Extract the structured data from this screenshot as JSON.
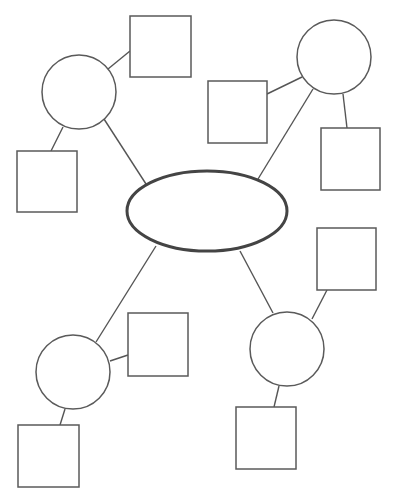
{
  "diagram": {
    "type": "mind-map",
    "background": "#ffffff",
    "stroke_color": "#5a5a5a",
    "center": {
      "id": "center",
      "shape": "ellipse",
      "cx": 207,
      "cy": 211,
      "rx": 80,
      "ry": 40,
      "label": ""
    },
    "branches": [
      {
        "id": "branch-top-left",
        "circle": {
          "cx": 79,
          "cy": 92,
          "r": 37,
          "label": ""
        },
        "connector": {
          "x1": 104,
          "y1": 119,
          "x2": 146,
          "y2": 184
        },
        "leaves": [
          {
            "id": "leaf-top-left-a",
            "x": 130,
            "y": 16,
            "w": 61,
            "h": 61,
            "label": "",
            "connector": {
              "x1": 108,
              "y1": 69,
              "x2": 130,
              "y2": 51
            }
          },
          {
            "id": "leaf-top-left-b",
            "x": 17,
            "y": 151,
            "w": 60,
            "h": 61,
            "label": "",
            "connector": {
              "x1": 63,
              "y1": 127,
              "x2": 51,
              "y2": 151
            }
          }
        ]
      },
      {
        "id": "branch-top-right",
        "circle": {
          "cx": 334,
          "cy": 57,
          "r": 37,
          "label": ""
        },
        "connector": {
          "x1": 313,
          "y1": 89,
          "x2": 258,
          "y2": 179
        },
        "leaves": [
          {
            "id": "leaf-top-right-a",
            "x": 208,
            "y": 81,
            "w": 59,
            "h": 62,
            "label": "",
            "connector": {
              "x1": 302,
              "y1": 77,
              "x2": 267,
              "y2": 94
            }
          },
          {
            "id": "leaf-top-right-b",
            "x": 321,
            "y": 128,
            "w": 59,
            "h": 62,
            "label": "",
            "connector": {
              "x1": 343,
              "y1": 94,
              "x2": 347,
              "y2": 128
            }
          }
        ]
      },
      {
        "id": "branch-bottom-left",
        "circle": {
          "cx": 73,
          "cy": 372,
          "r": 37,
          "label": ""
        },
        "connector": {
          "x1": 156,
          "y1": 246,
          "x2": 96,
          "y2": 342
        },
        "leaves": [
          {
            "id": "leaf-bottom-left-a",
            "x": 128,
            "y": 313,
            "w": 60,
            "h": 63,
            "label": "",
            "connector": {
              "x1": 110,
              "y1": 361,
              "x2": 128,
              "y2": 355
            }
          },
          {
            "id": "leaf-bottom-left-b",
            "x": 18,
            "y": 425,
            "w": 61,
            "h": 62,
            "label": "",
            "connector": {
              "x1": 65,
              "y1": 409,
              "x2": 60,
              "y2": 425
            }
          }
        ]
      },
      {
        "id": "branch-bottom-right",
        "circle": {
          "cx": 287,
          "cy": 349,
          "r": 37,
          "label": ""
        },
        "connector": {
          "x1": 240,
          "y1": 251,
          "x2": 273,
          "y2": 313
        },
        "leaves": [
          {
            "id": "leaf-bottom-right-a",
            "x": 317,
            "y": 228,
            "w": 59,
            "h": 62,
            "label": "",
            "connector": {
              "x1": 312,
              "y1": 319,
              "x2": 327,
              "y2": 290
            }
          },
          {
            "id": "leaf-bottom-right-b",
            "x": 236,
            "y": 407,
            "w": 60,
            "h": 62,
            "label": "",
            "connector": {
              "x1": 279,
              "y1": 386,
              "x2": 274,
              "y2": 407
            }
          }
        ]
      }
    ]
  }
}
